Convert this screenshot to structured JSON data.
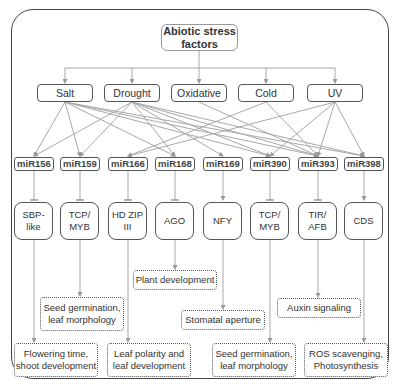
{
  "root": {
    "label": "Abiotic stress factors"
  },
  "stresses": [
    {
      "id": "salt",
      "label": "Salt"
    },
    {
      "id": "drought",
      "label": "Drought"
    },
    {
      "id": "oxidative",
      "label": "Oxidative"
    },
    {
      "id": "cold",
      "label": "Cold"
    },
    {
      "id": "uv",
      "label": "UV"
    }
  ],
  "mirnas": [
    {
      "id": "mir156",
      "label": "miR156"
    },
    {
      "id": "mir159",
      "label": "miR159"
    },
    {
      "id": "mir166",
      "label": "miR166"
    },
    {
      "id": "mir168",
      "label": "miR168"
    },
    {
      "id": "mir169",
      "label": "miR169"
    },
    {
      "id": "mir390",
      "label": "miR390"
    },
    {
      "id": "mir393",
      "label": "miR393"
    },
    {
      "id": "mir398",
      "label": "miR398"
    }
  ],
  "targets": [
    {
      "id": "sbp",
      "label": "SBP-\nlike"
    },
    {
      "id": "tcp1",
      "label": "TCP/\nMYB"
    },
    {
      "id": "hdzip",
      "label": "HD ZIP\nIII"
    },
    {
      "id": "ago",
      "label": "AGO"
    },
    {
      "id": "nfy",
      "label": "NFY"
    },
    {
      "id": "tcp2",
      "label": "TCP/\nMYB"
    },
    {
      "id": "tir",
      "label": "TIR/\nAFB"
    },
    {
      "id": "cds",
      "label": "CDS"
    }
  ],
  "functions": [
    {
      "id": "f_flower",
      "label": "Flowering time, shoot development"
    },
    {
      "id": "f_seed1",
      "label": "Seed germination, leaf morphology"
    },
    {
      "id": "f_leafpol",
      "label": "Leaf polarity and leaf development"
    },
    {
      "id": "f_plant",
      "label": "Plant development"
    },
    {
      "id": "f_stomatal",
      "label": "Stomatal aperture"
    },
    {
      "id": "f_seed2",
      "label": "Seed germination, leaf morphology"
    },
    {
      "id": "f_auxin",
      "label": "Auxin signaling"
    },
    {
      "id": "f_ros",
      "label": "ROS scavenging, Photosynthesis"
    }
  ],
  "edges": {
    "stress_to_mirna": [
      [
        "salt",
        "mir156"
      ],
      [
        "salt",
        "mir159"
      ],
      [
        "salt",
        "mir168"
      ],
      [
        "salt",
        "mir390"
      ],
      [
        "salt",
        "mir393"
      ],
      [
        "salt",
        "mir398"
      ],
      [
        "drought",
        "mir156"
      ],
      [
        "drought",
        "mir159"
      ],
      [
        "drought",
        "mir168"
      ],
      [
        "drought",
        "mir169"
      ],
      [
        "drought",
        "mir390"
      ],
      [
        "drought",
        "mir393"
      ],
      [
        "drought",
        "mir398"
      ],
      [
        "oxidative",
        "mir393"
      ],
      [
        "cold",
        "mir166"
      ],
      [
        "cold",
        "mir393"
      ],
      [
        "uv",
        "mir166"
      ],
      [
        "uv",
        "mir390"
      ],
      [
        "uv",
        "mir393"
      ],
      [
        "uv",
        "mir398"
      ]
    ],
    "mirna_to_target": [
      [
        "mir156",
        "sbp",
        "inhibit"
      ],
      [
        "mir159",
        "tcp1",
        "inhibit"
      ],
      [
        "mir166",
        "hdzip",
        "inhibit"
      ],
      [
        "mir168",
        "ago",
        "inhibit"
      ],
      [
        "mir169",
        "nfy",
        "activate"
      ],
      [
        "mir390",
        "tcp2",
        "inhibit"
      ],
      [
        "mir393",
        "tir",
        "inhibit"
      ],
      [
        "mir398",
        "cds",
        "activate"
      ]
    ]
  },
  "colors": {
    "edge": "#a8a8a8",
    "box_border": "#555555",
    "frame": "#444444"
  }
}
